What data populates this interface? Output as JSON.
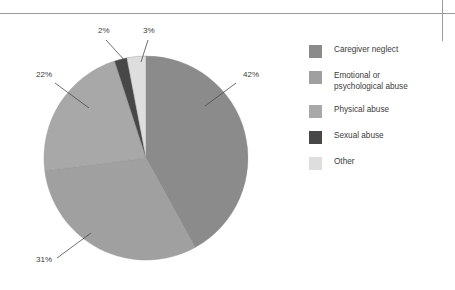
{
  "chart_data": {
    "type": "pie",
    "title": "",
    "categories": [
      "Caregiver neglect",
      "Emotional or psychological abuse",
      "Physical abuse",
      "Sexual abuse",
      "Other"
    ],
    "values": [
      42,
      31,
      22,
      2,
      3
    ],
    "value_labels": [
      "42%",
      "31%",
      "22%",
      "2%",
      "3%"
    ],
    "unit": "%",
    "colors": [
      "#8b8b8b",
      "#a0a0a0",
      "#a8a8a8",
      "#474747",
      "#dedede"
    ],
    "legend_position": "right",
    "grid": false,
    "labels_outside": true,
    "leader_lines": true
  },
  "slices": [
    {
      "name": "Caregiver neglect",
      "percent_label": "42%",
      "value": 42,
      "color": "#8b8b8b",
      "label_x": 243,
      "label_y": 77,
      "leader": "M 205,106 L 236,83"
    },
    {
      "name": "Physical abuse",
      "percent_label": "31%",
      "value": 31,
      "color": "#a0a0a0",
      "label_x": 36,
      "label_y": 262,
      "leader": "M 91,233 L 57,258"
    },
    {
      "name": "Emotional or psychological abuse",
      "percent_label": "22%",
      "value": 22,
      "color": "#a8a8a8",
      "label_x": 36,
      "label_y": 77,
      "leader": "M 89,108 L 55,83"
    },
    {
      "name": "Sexual abuse",
      "percent_label": "2%",
      "value": 2,
      "color": "#474747",
      "label_x": 98,
      "label_y": 33,
      "leader": "M 127,63 L 106,40"
    },
    {
      "name": "Other",
      "percent_label": "3%",
      "value": 3,
      "color": "#dedede",
      "label_x": 143,
      "label_y": 33,
      "leader": "M 141,62 L 148,40"
    }
  ],
  "legend": {
    "items": [
      {
        "label": "Caregiver neglect",
        "color": "#8b8b8b"
      },
      {
        "label": "Emotional or\npsychological abuse",
        "color": "#a0a0a0"
      },
      {
        "label": "Physical abuse",
        "color": "#a8a8a8"
      },
      {
        "label": "Sexual abuse",
        "color": "#474747"
      },
      {
        "label": "Other",
        "color": "#dedede"
      }
    ]
  },
  "geometry": {
    "center_x": 146,
    "center_y": 158,
    "radius": 102,
    "start_angle_deg": -90
  },
  "rules": {
    "horizontal_color": "#9a9a9a",
    "vertical_color": "#9a9a9a"
  }
}
